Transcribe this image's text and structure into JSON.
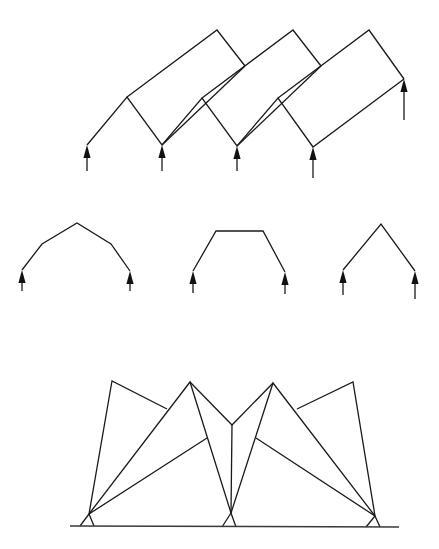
{
  "figure": {
    "width": 439,
    "height": 549,
    "colors": {
      "line": "#1a1a1a",
      "ground": "#3a3a3a",
      "background": "#ffffff"
    },
    "panels": [
      {
        "id": "folded-plate-roof",
        "description": "Folded plate roof (three inclined bays) on point supports with upward reaction arrows",
        "polylines": [
          [
            [
              87,
              145
            ],
            [
              127,
              97
            ],
            [
              162,
              145
            ],
            [
              202,
              98
            ],
            [
              237,
              146
            ],
            [
              278,
              98
            ],
            [
              313,
              147
            ],
            [
              404,
              79
            ]
          ],
          [
            [
              127,
              97
            ],
            [
              217,
              30
            ],
            [
              245,
              66
            ]
          ],
          [
            [
              202,
              98
            ],
            [
              293,
              30
            ],
            [
              321,
              66
            ]
          ],
          [
            [
              278,
              98
            ],
            [
              369,
              30
            ],
            [
              404,
              79
            ]
          ],
          [
            [
              245,
              66
            ],
            [
              162,
              145
            ]
          ],
          [
            [
              321,
              66
            ],
            [
              237,
              146
            ]
          ]
        ],
        "arrows": [
          {
            "tip": [
              87,
              145
            ],
            "tail": [
              87,
              171
            ]
          },
          {
            "tip": [
              162,
              145
            ],
            "tail": [
              162,
              171
            ]
          },
          {
            "tip": [
              237,
              146
            ],
            "tail": [
              237,
              171
            ]
          },
          {
            "tip": [
              313,
              147
            ],
            "tail": [
              313,
              178
            ]
          },
          {
            "tip": [
              404,
              79
            ],
            "tail": [
              404,
              120
            ]
          }
        ]
      },
      {
        "id": "polygonal-arch",
        "description": "Five-segment polygonal arch profile with reactions",
        "polylines": [
          [
            [
              22,
              270
            ],
            [
              42,
              244
            ],
            [
              77,
              223
            ],
            [
              111,
              244
            ],
            [
              130,
              271
            ]
          ]
        ],
        "arrows": [
          {
            "tip": [
              22,
              270
            ],
            "tail": [
              22,
              291
            ]
          },
          {
            "tip": [
              130,
              271
            ],
            "tail": [
              130,
              291
            ]
          }
        ]
      },
      {
        "id": "trapezoidal-frame",
        "description": "Trapezoidal (three-segment) frame profile with reactions",
        "polylines": [
          [
            [
              193,
              271
            ],
            [
              216,
              231
            ],
            [
              263,
              231
            ],
            [
              285,
              272
            ]
          ]
        ],
        "arrows": [
          {
            "tip": [
              193,
              271
            ],
            "tail": [
              193,
              293
            ]
          },
          {
            "tip": [
              285,
              272
            ],
            "tail": [
              285,
              294
            ]
          }
        ]
      },
      {
        "id": "triangular-frame",
        "description": "Two-segment triangular (gable) profile with reactions",
        "polylines": [
          [
            [
              343,
              270
            ],
            [
              381,
              224
            ],
            [
              415,
              271
            ]
          ]
        ],
        "arrows": [
          {
            "tip": [
              343,
              270
            ],
            "tail": [
              343,
              295
            ]
          },
          {
            "tip": [
              415,
              271
            ],
            "tail": [
              415,
              299
            ]
          }
        ]
      },
      {
        "id": "pinned-folded-truss",
        "description": "Folded plate / truss system on three pinned ground supports",
        "polylines": [
          [
            [
              89,
              514
            ],
            [
              112,
              381
            ],
            [
              167,
              409
            ]
          ],
          [
            [
              89,
              514
            ],
            [
              190,
              382
            ],
            [
              231,
              513
            ]
          ],
          [
            [
              89,
              514
            ],
            [
              207,
              438
            ]
          ],
          [
            [
              190,
              382
            ],
            [
              232,
              425
            ],
            [
              273,
              383
            ]
          ],
          [
            [
              232,
              425
            ],
            [
              231,
              513
            ]
          ],
          [
            [
              231,
              513
            ],
            [
              273,
              383
            ],
            [
              375,
              516
            ]
          ],
          [
            [
              256,
              438
            ],
            [
              375,
              516
            ]
          ],
          [
            [
              297,
              409
            ],
            [
              353,
              382
            ],
            [
              375,
              516
            ]
          ]
        ],
        "supports": [
          {
            "pin": [
              89,
              514
            ],
            "legs": [
              [
                80,
                526
              ],
              [
                94,
                526
              ]
            ]
          },
          {
            "pin": [
              231,
              513
            ],
            "legs": [
              [
                222,
                527
              ],
              [
                236,
                527
              ]
            ]
          },
          {
            "pin": [
              375,
              516
            ],
            "legs": [
              [
                366,
                527
              ],
              [
                380,
                527
              ]
            ]
          }
        ],
        "ground": [
          [
            70,
            526
          ],
          [
            399,
            527
          ]
        ]
      }
    ]
  }
}
